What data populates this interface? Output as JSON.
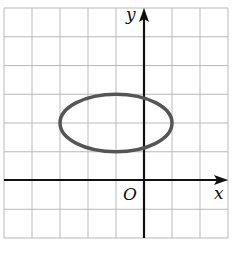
{
  "chart_data": {
    "type": "line",
    "title": "",
    "xlabel": "x",
    "ylabel": "y",
    "origin_label": "O",
    "xlim": [
      -5,
      3
    ],
    "ylim": [
      -2,
      6
    ],
    "grid": true,
    "grid_step": 1,
    "tick_labels_shown": false,
    "series": [
      {
        "name": "ellipse",
        "shape": "ellipse",
        "center": [
          -1,
          2
        ],
        "semi_axis_x": 2,
        "semi_axis_y": 1,
        "equation": "(x+1)^2/4 + (y-2)^2/1 = 1",
        "color": "#555555"
      }
    ]
  },
  "colors": {
    "grid": "#b9b9b9",
    "axes": "#111111",
    "curve": "#555555"
  }
}
